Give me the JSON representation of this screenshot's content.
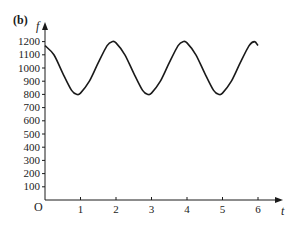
{
  "panel": {
    "label": "(b)"
  },
  "chart_data": {
    "type": "line",
    "title": "",
    "xlabel": "t",
    "ylabel": "f",
    "origin_label": "O",
    "xlim": [
      0,
      6
    ],
    "ylim": [
      0,
      1200
    ],
    "x_ticks": [
      1,
      2,
      3,
      4,
      5,
      6
    ],
    "y_ticks": [
      100,
      200,
      300,
      400,
      500,
      600,
      700,
      800,
      900,
      1000,
      1100,
      1200
    ],
    "grid": false,
    "legend": null,
    "series": [
      {
        "name": "f(t)",
        "color": "#1a1a1a",
        "x": [
          0,
          0.25,
          0.5,
          0.75,
          0.9,
          1.0,
          1.25,
          1.5,
          1.75,
          1.9,
          2.0,
          2.25,
          2.5,
          2.75,
          2.9,
          3.0,
          3.25,
          3.5,
          3.75,
          3.9,
          4.0,
          4.25,
          4.5,
          4.75,
          4.9,
          5.0,
          5.25,
          5.5,
          5.75,
          5.9,
          6.0
        ],
        "y": [
          1170,
          1100,
          960,
          830,
          800,
          810,
          900,
          1040,
          1170,
          1200,
          1190,
          1100,
          960,
          830,
          800,
          810,
          900,
          1040,
          1170,
          1200,
          1190,
          1100,
          960,
          830,
          800,
          810,
          900,
          1040,
          1170,
          1200,
          1170
        ]
      }
    ],
    "annotations": [
      "minima ≈ 800 at t ≈ 0.9, 2.9, 4.9",
      "maxima ≈ 1200 at t ≈ 1.9, 3.9, 5.9"
    ]
  }
}
